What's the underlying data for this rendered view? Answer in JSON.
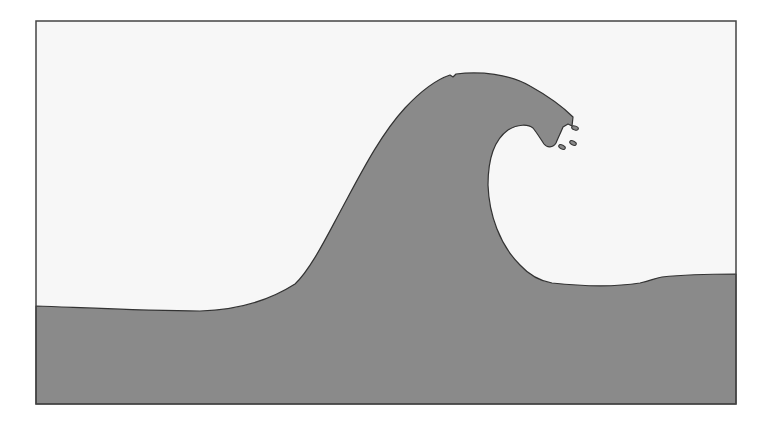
{
  "illustration": {
    "subject": "Breaking ocean wave",
    "colors": {
      "page_background": "#ffffff",
      "sky": "#f7f7f7",
      "water": "#8a8a8a",
      "outline": "#333333"
    },
    "elements": [
      "frame",
      "sky",
      "wave-body",
      "wave-crest",
      "spray-droplets"
    ]
  }
}
